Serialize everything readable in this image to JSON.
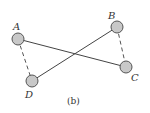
{
  "diagram": {
    "caption": "(b)",
    "colors": {
      "node_fill": "#c8c8c8",
      "node_stroke": "#555555",
      "solid_edge": "#444444",
      "dashed_edge": "#555555",
      "background": "#ffffff"
    },
    "nodes": [
      {
        "id": "A",
        "label": "A",
        "x": 18,
        "y": 39,
        "label_x": 14,
        "label_y": 30
      },
      {
        "id": "B",
        "label": "B",
        "x": 117,
        "y": 27,
        "label_x": 108,
        "label_y": 18
      },
      {
        "id": "C",
        "label": "C",
        "x": 126,
        "y": 67,
        "label_x": 131,
        "label_y": 81
      },
      {
        "id": "D",
        "label": "D",
        "x": 32,
        "y": 81,
        "label_x": 25,
        "label_y": 98
      }
    ],
    "edges": [
      {
        "from": "A",
        "to": "C",
        "style": "solid"
      },
      {
        "from": "D",
        "to": "B",
        "style": "solid"
      },
      {
        "from": "A",
        "to": "D",
        "style": "dashed"
      },
      {
        "from": "B",
        "to": "C",
        "style": "dashed"
      }
    ]
  }
}
